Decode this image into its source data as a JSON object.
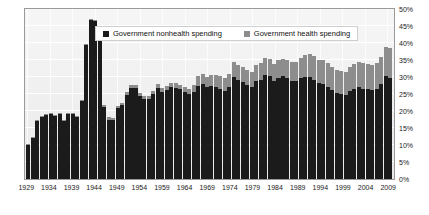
{
  "chart_data": {
    "type": "bar",
    "stacked": true,
    "title": "",
    "subtitle": "",
    "xlabel": "",
    "ylabel": "",
    "ylim": [
      0,
      50
    ],
    "ytick_labels": [
      "0%",
      "5%",
      "10%",
      "15%",
      "20%",
      "25%",
      "30%",
      "35%",
      "40%",
      "45%",
      "50%"
    ],
    "ytick_values": [
      0,
      5,
      10,
      15,
      20,
      25,
      30,
      35,
      40,
      45,
      50
    ],
    "xtick_labels": [
      "1929",
      "1934",
      "1939",
      "1944",
      "1949",
      "1954",
      "1959",
      "1964",
      "1969",
      "1974",
      "1979",
      "1984",
      "1989",
      "1994",
      "1999",
      "2004",
      "2009"
    ],
    "grid": true,
    "legend_position": "top-center",
    "legend": [
      {
        "name": "Government nonhealth spending",
        "color": "#1b1b1b"
      },
      {
        "name": "Government health spending",
        "color": "#8d8d8d"
      }
    ],
    "categories": [
      1929,
      1930,
      1931,
      1932,
      1933,
      1934,
      1935,
      1936,
      1937,
      1938,
      1939,
      1940,
      1941,
      1942,
      1943,
      1944,
      1945,
      1946,
      1947,
      1948,
      1949,
      1950,
      1951,
      1952,
      1953,
      1954,
      1955,
      1956,
      1957,
      1958,
      1959,
      1960,
      1961,
      1962,
      1963,
      1964,
      1965,
      1966,
      1967,
      1968,
      1969,
      1970,
      1971,
      1972,
      1973,
      1974,
      1975,
      1976,
      1977,
      1978,
      1979,
      1980,
      1981,
      1982,
      1983,
      1984,
      1985,
      1986,
      1987,
      1988,
      1989,
      1990,
      1991,
      1992,
      1993,
      1994,
      1995,
      1996,
      1997,
      1998,
      1999,
      2000,
      2001,
      2002,
      2003,
      2004,
      2005,
      2006,
      2007,
      2008,
      2009,
      2010
    ],
    "series": [
      {
        "name": "Government nonhealth spending",
        "color": "#1b1b1b",
        "values": [
          10.0,
          12.2,
          17.0,
          18.3,
          18.7,
          19.0,
          18.6,
          19.2,
          17.0,
          19.0,
          19.1,
          18.2,
          22.8,
          39.3,
          46.8,
          46.5,
          41.5,
          21.2,
          17.5,
          17.4,
          20.8,
          21.7,
          24.7,
          26.8,
          26.9,
          24.4,
          23.5,
          23.6,
          25.0,
          26.8,
          25.7,
          26.1,
          27.0,
          26.8,
          26.4,
          25.7,
          25.0,
          25.7,
          27.5,
          27.8,
          27.0,
          27.4,
          27.1,
          26.6,
          26.0,
          27.0,
          30.0,
          29.0,
          28.4,
          27.6,
          27.2,
          28.8,
          29.2,
          30.5,
          30.2,
          28.8,
          29.8,
          30.2,
          29.6,
          28.9,
          28.8,
          29.6,
          30.0,
          30.0,
          29.2,
          28.2,
          28.0,
          27.2,
          26.2,
          25.4,
          25.1,
          24.8,
          26.0,
          26.6,
          27.0,
          26.6,
          26.4,
          26.2,
          26.5,
          28.0,
          30.2,
          29.8
        ]
      },
      {
        "name": "Government health spending",
        "color": "#8d8d8d",
        "values": [
          0.2,
          0.2,
          0.3,
          0.3,
          0.3,
          0.3,
          0.3,
          0.3,
          0.3,
          0.3,
          0.4,
          0.4,
          0.3,
          0.3,
          0.3,
          0.4,
          0.4,
          0.5,
          0.6,
          0.6,
          0.7,
          0.8,
          0.8,
          0.8,
          0.8,
          0.8,
          0.9,
          0.9,
          1.0,
          1.1,
          1.1,
          1.2,
          1.3,
          1.3,
          1.4,
          1.4,
          1.4,
          2.0,
          2.7,
          3.0,
          3.1,
          3.3,
          3.5,
          3.6,
          3.6,
          4.0,
          4.5,
          4.5,
          4.5,
          4.4,
          4.4,
          4.8,
          4.9,
          5.0,
          5.2,
          5.0,
          5.1,
          5.2,
          5.4,
          5.4,
          5.6,
          6.0,
          6.5,
          6.8,
          6.9,
          6.9,
          7.0,
          6.9,
          6.8,
          6.7,
          6.6,
          6.6,
          6.9,
          7.2,
          7.4,
          7.4,
          7.4,
          7.4,
          7.6,
          8.0,
          8.6,
          8.8
        ]
      }
    ]
  }
}
